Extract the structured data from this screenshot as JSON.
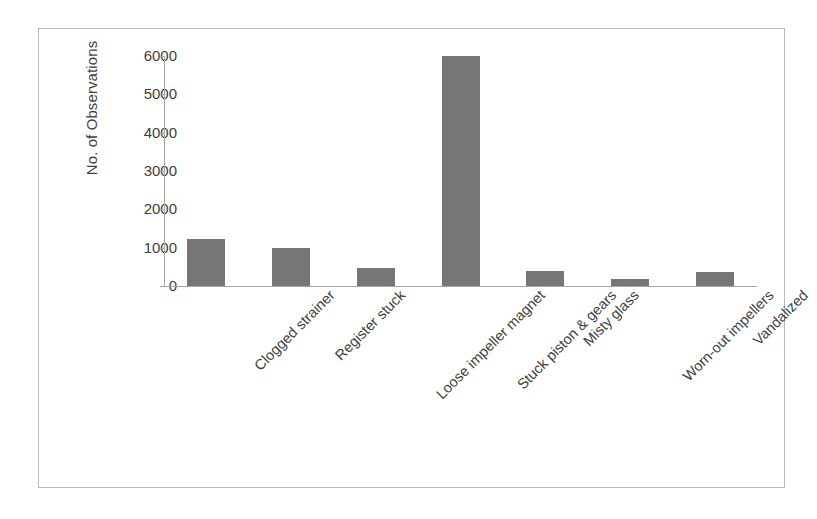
{
  "chart_data": {
    "type": "bar",
    "title": "",
    "subtitle": "",
    "xlabel": "",
    "ylabel": "No. of Observations",
    "categories": [
      "Clogged strainer",
      "Register stuck",
      "Loose impeller magnet",
      "Stuck piston & gears",
      "Misty glass",
      "Worn-out impellers",
      "Vandalized"
    ],
    "values": [
      1230,
      990,
      470,
      6000,
      400,
      170,
      360
    ],
    "ylim": [
      0,
      6000
    ],
    "ytick_labels": [
      "6000",
      "5000",
      "4000",
      "3000",
      "2000",
      "1000",
      "0"
    ],
    "ytick_values": [
      6000,
      5000,
      4000,
      3000,
      2000,
      1000,
      0
    ],
    "grid": false,
    "legend": false,
    "legend_position": "none",
    "bar_color": "#767676",
    "axis_color": "#a6a6a6",
    "text_color": "#404040",
    "frame_color": "#b8b8b8",
    "background": "#ffffff",
    "xtick_label_rotation": -45
  }
}
